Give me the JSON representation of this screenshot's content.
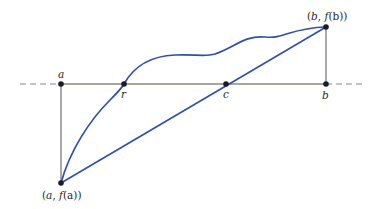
{
  "diagram": {
    "colors": {
      "curve": "#2f4fb0",
      "secant": "#2f4fb0",
      "axis": "#8a8a7a",
      "dashes": "#8a8a8a",
      "vertical": "#555555",
      "point": "#1a1a2a"
    },
    "labels": {
      "a": "a",
      "r": "r",
      "c": "c",
      "b": "b",
      "fa_open": "(",
      "fa_var": "a",
      "fa_sep": ", ",
      "fa_f": "f",
      "fa_inner": "(a)",
      "fa_close": ")",
      "fb_open": "(",
      "fb_var": "b",
      "fb_sep": ", ",
      "fb_f": "f",
      "fb_inner": "(b)",
      "fb_close": ")"
    },
    "points": [
      "a",
      "r",
      "c",
      "b",
      "(a, f(a))",
      "(b, f(b))"
    ]
  }
}
